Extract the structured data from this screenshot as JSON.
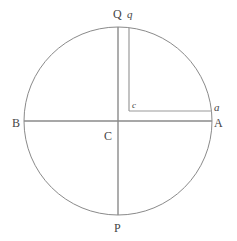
{
  "figure": {
    "kind": "geometry-diagram",
    "background_color": "#ffffff",
    "stroke_color": "#8a8a8a",
    "label_color": "#454545",
    "circle": {
      "center_x": 118,
      "center_y": 121,
      "radius": 94,
      "stroke_width": 1
    },
    "lines": [
      {
        "name": "horizontal-diameter-BA",
        "x1": 24,
        "y1": 121,
        "x2": 212,
        "y2": 121
      },
      {
        "name": "vertical-diameter-QP",
        "x1": 118,
        "y1": 27,
        "x2": 118,
        "y2": 215
      },
      {
        "name": "chord-q-to-c",
        "x1": 129,
        "y1": 28,
        "x2": 129,
        "y2": 111
      },
      {
        "name": "chord-c-to-a",
        "x1": 129,
        "y1": 111,
        "x2": 212,
        "y2": 111
      }
    ],
    "labels": [
      {
        "name": "label-Q",
        "text": "Q",
        "x": 113,
        "y": 8,
        "style": "upright"
      },
      {
        "name": "label-q",
        "text": "q",
        "x": 127,
        "y": 9,
        "style": "italic"
      },
      {
        "name": "label-a",
        "text": "a",
        "x": 214,
        "y": 102,
        "style": "italic"
      },
      {
        "name": "label-A",
        "text": "A",
        "x": 214,
        "y": 117,
        "style": "upright"
      },
      {
        "name": "label-c",
        "text": "c",
        "x": 132,
        "y": 101,
        "style": "italic-small"
      },
      {
        "name": "label-B",
        "text": "B",
        "x": 12,
        "y": 117,
        "style": "upright"
      },
      {
        "name": "label-C",
        "text": "C",
        "x": 104,
        "y": 130,
        "style": "upright"
      },
      {
        "name": "label-P",
        "text": "P",
        "x": 114,
        "y": 222,
        "style": "upright"
      }
    ]
  }
}
